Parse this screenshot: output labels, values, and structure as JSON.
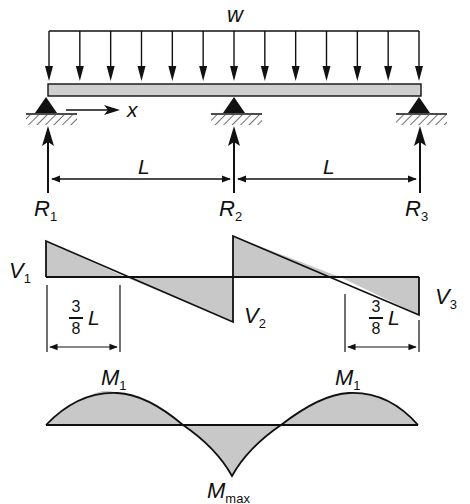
{
  "labels": {
    "load": "w",
    "x_axis": "x",
    "span1": "L",
    "span2": "L",
    "R1": {
      "main": "R",
      "sub": "1"
    },
    "R2": {
      "main": "R",
      "sub": "2"
    },
    "R3": {
      "main": "R",
      "sub": "3"
    },
    "V1": {
      "main": "V",
      "sub": "1"
    },
    "V2": {
      "main": "V",
      "sub": "2"
    },
    "V3": {
      "main": "V",
      "sub": "3"
    },
    "dim_left": {
      "num": "3",
      "den": "8",
      "var": "L"
    },
    "dim_right": {
      "num": "3",
      "den": "8",
      "var": "L"
    },
    "M1_left": {
      "main": "M",
      "sub": "1"
    },
    "M1_right": {
      "main": "M",
      "sub": "1"
    },
    "Mmax": {
      "main": "M",
      "sub": "max"
    }
  },
  "colors": {
    "line": "#111111",
    "fill": "#c8c8c8",
    "beam_fill": "#cfcfcf"
  },
  "diagram": {
    "beam": {
      "x0": 48,
      "x1": 421,
      "y_top": 84,
      "y_bot": 96
    },
    "supports_x": [
      46,
      234,
      419
    ],
    "load_arrow_count": 13,
    "shear": {
      "baseline_y": 277,
      "points": [
        [
          46,
          241
        ],
        [
          125,
          277
        ],
        [
          233,
          322
        ],
        [
          233,
          236
        ],
        [
          340,
          277
        ],
        [
          419,
          315
        ]
      ]
    },
    "moment": {
      "baseline_y": 425,
      "zero_crossings_x": [
        183,
        281
      ],
      "M1_peak_y": 394,
      "Mmax_y": 476
    }
  }
}
